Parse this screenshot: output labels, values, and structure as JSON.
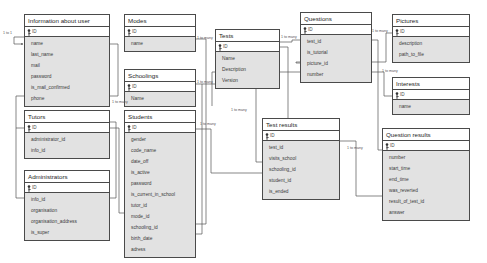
{
  "diagram": {
    "background_color": "#ffffff",
    "entity_header_color": "#ffffff",
    "entity_body_color": "#e2e2e2",
    "border_color": "#4a4a4a",
    "line_color": "#555555"
  },
  "entities": [
    {
      "name": "information-about-user",
      "title": "Information about user",
      "pk": "ID",
      "x": 24,
      "y": 14,
      "w": 86,
      "attributes": [
        "name",
        "last_name",
        "mail",
        "password",
        "is_mail_confirmed",
        "phone"
      ]
    },
    {
      "name": "tutors",
      "title": "Tutors",
      "pk": "ID",
      "x": 24,
      "y": 110,
      "w": 86,
      "attributes": [
        "administrator_id",
        "info_id"
      ]
    },
    {
      "name": "administrators",
      "title": "Administrators",
      "pk": "ID",
      "x": 24,
      "y": 170,
      "w": 86,
      "attributes": [
        "info_id",
        "organisation",
        "organisation_address",
        "is_super"
      ]
    },
    {
      "name": "modes",
      "title": "Modes",
      "pk": "ID",
      "x": 124,
      "y": 14,
      "w": 72,
      "attributes": [
        "name"
      ]
    },
    {
      "name": "schoolings",
      "title": "Schoolings",
      "pk": "ID",
      "x": 124,
      "y": 69,
      "w": 72,
      "attributes": [
        "Name"
      ]
    },
    {
      "name": "students",
      "title": "Students",
      "pk": "ID",
      "x": 124,
      "y": 110,
      "w": 72,
      "attributes": [
        "gender",
        "code_name",
        "date_off",
        "is_active",
        "password",
        "is_current_in_school",
        "tutor_id",
        "mode_id",
        "schooling_id",
        "birth_date",
        "adress"
      ]
    },
    {
      "name": "tests",
      "title": "Tests",
      "pk": "ID",
      "x": 215,
      "y": 29,
      "w": 65,
      "attributes": [
        "Name",
        "Description",
        "Version"
      ]
    },
    {
      "name": "test-results",
      "title": "Test results",
      "pk": "ID",
      "x": 262,
      "y": 118,
      "w": 78,
      "attributes": [
        "test_id",
        "visits_school",
        "schooling_id",
        "student_id",
        "is_ended"
      ]
    },
    {
      "name": "questions",
      "title": "Questions",
      "pk": "ID",
      "x": 300,
      "y": 12,
      "w": 72,
      "attributes": [
        "test_id",
        "is_tutorial",
        "picture_id",
        "number"
      ]
    },
    {
      "name": "pictures",
      "title": "Pictures",
      "pk": "ID",
      "x": 392,
      "y": 14,
      "w": 78,
      "attributes": [
        "description",
        "path_to_file"
      ]
    },
    {
      "name": "interests",
      "title": "Interests",
      "pk": "ID",
      "x": 392,
      "y": 77,
      "w": 78,
      "attributes": [
        "name"
      ]
    },
    {
      "name": "question-results",
      "title": "Question results",
      "pk": "ID",
      "x": 382,
      "y": 128,
      "w": 88,
      "attributes": [
        "number",
        "start_time",
        "end_time",
        "was_reverted",
        "result_of_test_id",
        "answer"
      ]
    }
  ],
  "relationship_labels": [
    {
      "name": "info-user-self",
      "text": "1 to 1",
      "x": 3,
      "y": 31
    },
    {
      "name": "modes-students",
      "text": "1 to many",
      "x": 197,
      "y": 43
    },
    {
      "name": "schoolings-students",
      "text": "1 to many",
      "x": 197,
      "y": 80
    },
    {
      "name": "tutors-students",
      "text": "1 to many",
      "x": 112,
      "y": 100
    },
    {
      "name": "students-testresults",
      "text": "1 to many",
      "x": 200,
      "y": 122
    },
    {
      "name": "tests-questions",
      "text": "1 to many",
      "x": 282,
      "y": 34
    },
    {
      "name": "tests-testresults",
      "text": "1 to many",
      "x": 231,
      "y": 108
    },
    {
      "name": "pictures-questions",
      "text": "1 to many",
      "x": 374,
      "y": 30
    },
    {
      "name": "interests-students",
      "text": "1 to many",
      "x": 383,
      "y": 70
    },
    {
      "name": "testresults-questionresults",
      "text": "1 to many",
      "x": 347,
      "y": 146
    }
  ]
}
